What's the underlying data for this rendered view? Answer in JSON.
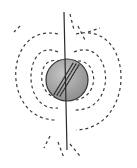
{
  "diagram": {
    "colors": {
      "background": "#ffffff",
      "field_line": "#3a3a3a",
      "axis_line": "#2a2a2a",
      "sphere_fill": "#9a9a9a",
      "sphere_highlight": "#bdbdbd",
      "sphere_outline": "#333333",
      "interior_dots": "#2e2e2e"
    },
    "sphere": {
      "cx": 67,
      "cy": 80,
      "r": 21
    },
    "axis": {
      "x1": 64,
      "y1": 12,
      "x2": 67,
      "y2": 150
    },
    "field_loops": {
      "left": [
        {
          "name": "inner",
          "d": "M60 62 C 38 52, 34 95, 58 98"
        },
        {
          "name": "middle",
          "d": "M58 52 C 24 36, 20 112, 58 108"
        },
        {
          "name": "outer",
          "d": "M58 34 C 4 22, 0 120, 56 120"
        }
      ],
      "right": [
        {
          "name": "inner",
          "d": "M72 62 C 98 54, 102 96, 76 100"
        },
        {
          "name": "middle",
          "d": "M74 52 C 112 36, 120 112, 74 110"
        },
        {
          "name": "outer",
          "d": "M76 34 C 134 20, 138 128, 76 130"
        }
      ]
    },
    "polar_dashes": [
      {
        "d": "M70 14 L74 30"
      },
      {
        "d": "M78 26 L86 42"
      },
      {
        "d": "M88 32 L100 28"
      },
      {
        "d": "M58 142 L64 158"
      },
      {
        "d": "M70 144 L80 156"
      },
      {
        "d": "M50 136 L44 148"
      },
      {
        "d": "M20 26 L14 32"
      }
    ]
  }
}
